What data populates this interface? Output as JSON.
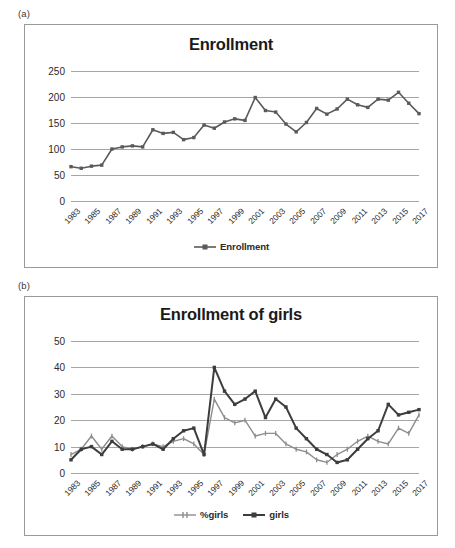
{
  "figure": {
    "panels": [
      {
        "label": "(a)"
      },
      {
        "label": "(b)"
      }
    ]
  },
  "chart_data": [
    {
      "panel": "(a)",
      "type": "line",
      "title": "Enrollment",
      "xlabel": "",
      "ylabel": "",
      "ylim": [
        0,
        250
      ],
      "yticks": [
        0,
        50,
        100,
        150,
        200,
        250
      ],
      "grid": true,
      "legend_position": "bottom",
      "x": [
        1983,
        1984,
        1985,
        1986,
        1987,
        1988,
        1989,
        1990,
        1991,
        1992,
        1993,
        1994,
        1995,
        1996,
        1997,
        1998,
        1999,
        2000,
        2001,
        2002,
        2003,
        2004,
        2005,
        2006,
        2007,
        2008,
        2009,
        2010,
        2011,
        2012,
        2013,
        2014,
        2015,
        2016,
        2017
      ],
      "xtick_labels": [
        "1983",
        "1985",
        "1987",
        "1989",
        "1991",
        "1993",
        "1995",
        "1997",
        "1999",
        "2001",
        "2003",
        "2005",
        "2007",
        "2009",
        "2011",
        "2013",
        "2015",
        "2017"
      ],
      "series": [
        {
          "name": "Enrollment",
          "color": "#5a5a5a",
          "marker": "square",
          "values": [
            66,
            63,
            67,
            69,
            100,
            104,
            106,
            104,
            137,
            130,
            132,
            118,
            122,
            146,
            140,
            152,
            158,
            155,
            199,
            174,
            171,
            148,
            133,
            151,
            178,
            167,
            177,
            196,
            185,
            180,
            196,
            194,
            209,
            188,
            168
          ]
        }
      ]
    },
    {
      "panel": "(b)",
      "type": "line",
      "title": "Enrollment of girls",
      "xlabel": "",
      "ylabel": "",
      "ylim": [
        0,
        50
      ],
      "yticks": [
        0,
        10,
        20,
        30,
        40,
        50
      ],
      "grid": true,
      "legend_position": "bottom",
      "x": [
        1983,
        1984,
        1985,
        1986,
        1987,
        1988,
        1989,
        1990,
        1991,
        1992,
        1993,
        1994,
        1995,
        1996,
        1997,
        1998,
        1999,
        2000,
        2001,
        2002,
        2003,
        2004,
        2005,
        2006,
        2007,
        2008,
        2009,
        2010,
        2011,
        2012,
        2013,
        2014,
        2015,
        2016,
        2017
      ],
      "xtick_labels": [
        "1983",
        "1985",
        "1987",
        "1989",
        "1991",
        "1993",
        "1995",
        "1997",
        "1999",
        "2001",
        "2003",
        "2005",
        "2007",
        "2009",
        "2011",
        "2013",
        "2015",
        "2017"
      ],
      "series": [
        {
          "name": "%girls",
          "color": "#8d8d8d",
          "marker": "cross",
          "values": [
            7,
            9,
            14,
            9,
            14,
            10,
            9,
            10,
            11,
            10,
            12,
            13,
            11,
            7,
            28,
            21,
            19,
            20,
            14,
            15,
            15,
            11,
            9,
            8,
            5,
            4,
            7,
            9,
            12,
            14,
            12,
            11,
            17,
            15,
            22,
            21
          ]
        },
        {
          "name": "girls",
          "color": "#3d3d3d",
          "marker": "square",
          "values": [
            5,
            9,
            10,
            7,
            12,
            9,
            9,
            10,
            11,
            9,
            13,
            16,
            17,
            7,
            40,
            31,
            26,
            28,
            31,
            21,
            28,
            25,
            17,
            13,
            9,
            7,
            4,
            5,
            9,
            13,
            16,
            26,
            22,
            23,
            24,
            21,
            31,
            32,
            40,
            34
          ]
        }
      ]
    }
  ]
}
